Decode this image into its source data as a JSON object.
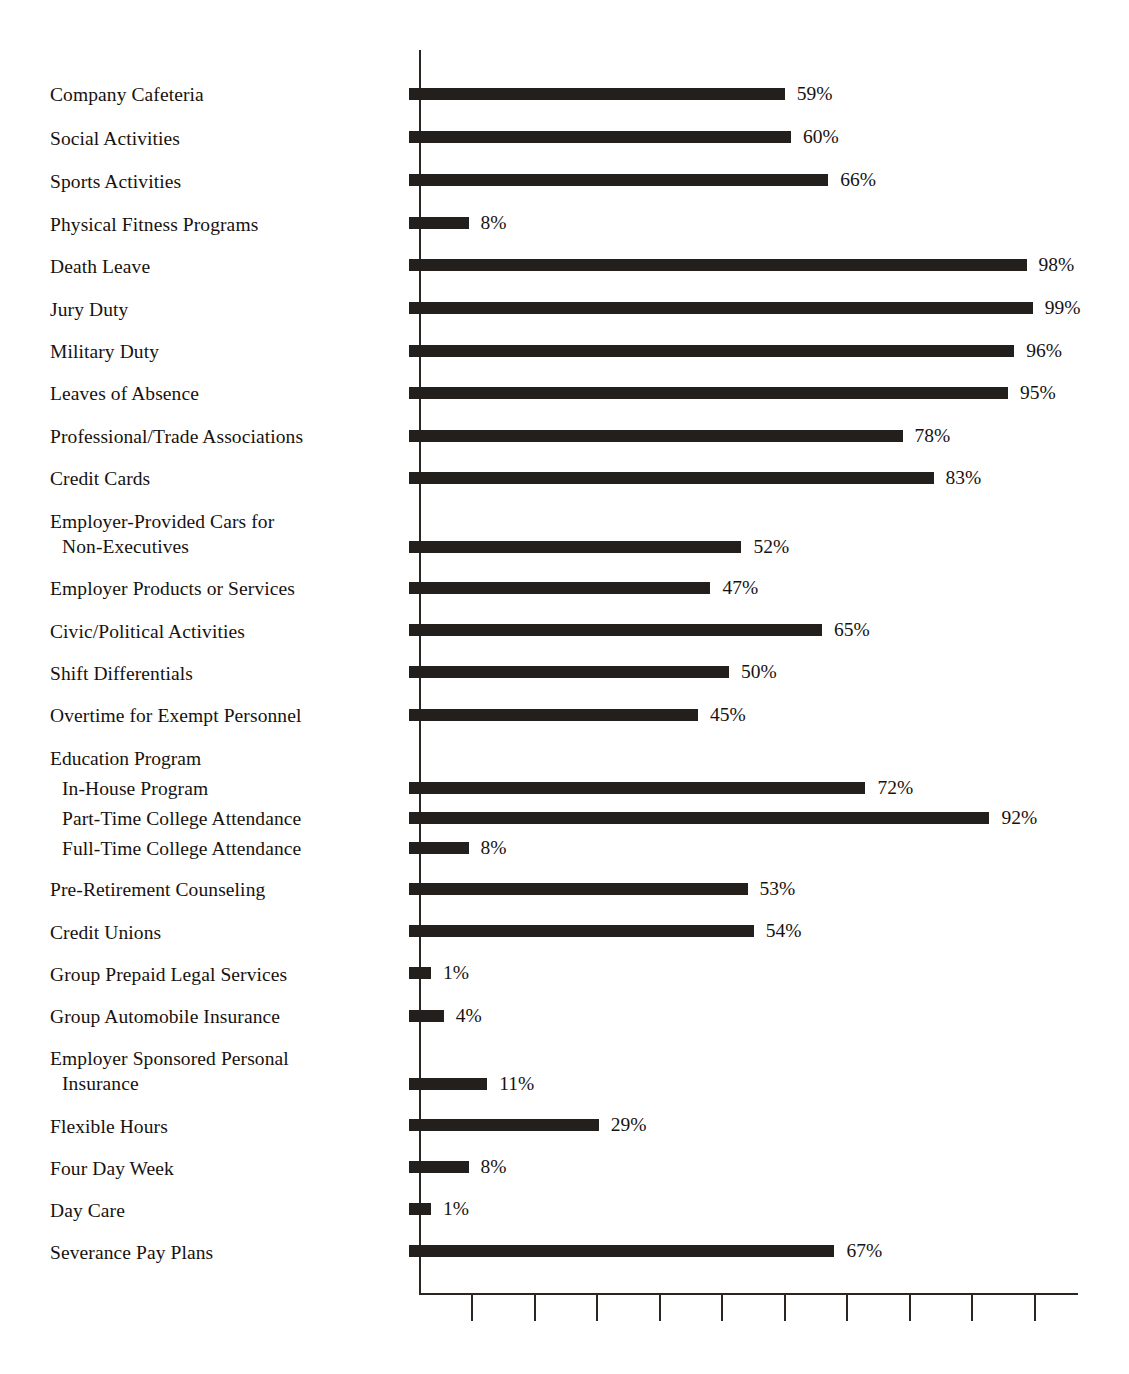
{
  "chart_data": {
    "type": "bar",
    "orientation": "horizontal",
    "title": "",
    "subtitle": "",
    "xlabel": "",
    "ylabel": "",
    "xlim": [
      0,
      100
    ],
    "grid": false,
    "legend": null,
    "value_suffix": "%",
    "axis": {
      "tick_count": 10,
      "tick_values": [
        10,
        20,
        30,
        40,
        50,
        60,
        70,
        80,
        90,
        100
      ],
      "tick_labels": [
        "",
        "",
        "",
        "",
        "",
        "",
        "",
        "",
        "",
        ""
      ],
      "tick_labels_visible": false,
      "axis_color": "#2b2622"
    },
    "bar_color": "#231f1c",
    "categories": [
      "Company Cafeteria",
      "Social Activities",
      "Sports Activities",
      "Physical Fitness Programs",
      "Death Leave",
      "Jury Duty",
      "Military Duty",
      "Leaves of Absence",
      "Professional/Trade Associations",
      "Credit Cards",
      "Employer-Provided Cars for Non-Executives",
      "Employer Products or Services",
      "Civic/Political Activities",
      "Shift Differentials",
      "Overtime for Exempt Personnel",
      "In-House Program",
      "Part-Time College Attendance",
      "Full-Time College Attendance",
      "Pre-Retirement Counseling",
      "Credit Unions",
      "Group Prepaid Legal Services",
      "Group Automobile Insurance",
      "Employer Sponsored Personal Insurance",
      "Flexible Hours",
      "Four Day Week",
      "Day Care",
      "Severance Pay Plans"
    ],
    "values": [
      59,
      60,
      66,
      8,
      98,
      99,
      96,
      95,
      78,
      83,
      52,
      47,
      65,
      50,
      45,
      72,
      92,
      8,
      53,
      54,
      1,
      4,
      11,
      29,
      8,
      1,
      67
    ]
  },
  "rows": [
    {
      "label_lines": [
        "Company Cafeteria"
      ],
      "indent": 0,
      "value": 59,
      "value_label": "59%",
      "label_top": 82,
      "bar_top": 88
    },
    {
      "label_lines": [
        "Social Activities"
      ],
      "indent": 0,
      "value": 60,
      "value_label": "60%",
      "label_top": 126,
      "bar_top": 131
    },
    {
      "label_lines": [
        "Sports Activities"
      ],
      "indent": 0,
      "value": 66,
      "value_label": "66%",
      "label_top": 169,
      "bar_top": 174
    },
    {
      "label_lines": [
        "Physical Fitness Programs"
      ],
      "indent": 0,
      "value": 8,
      "value_label": "8%",
      "label_top": 212,
      "bar_top": 217
    },
    {
      "label_lines": [
        "Death Leave"
      ],
      "indent": 0,
      "value": 98,
      "value_label": "98%",
      "label_top": 254,
      "bar_top": 259
    },
    {
      "label_lines": [
        "Jury Duty"
      ],
      "indent": 0,
      "value": 99,
      "value_label": "99%",
      "label_top": 297,
      "bar_top": 302
    },
    {
      "label_lines": [
        "Military Duty"
      ],
      "indent": 0,
      "value": 96,
      "value_label": "96%",
      "label_top": 339,
      "bar_top": 345
    },
    {
      "label_lines": [
        "Leaves of Absence"
      ],
      "indent": 0,
      "value": 95,
      "value_label": "95%",
      "label_top": 381,
      "bar_top": 387
    },
    {
      "label_lines": [
        "Professional/Trade Associations"
      ],
      "indent": 0,
      "value": 78,
      "value_label": "78%",
      "label_top": 424,
      "bar_top": 430
    },
    {
      "label_lines": [
        "Credit Cards"
      ],
      "indent": 0,
      "value": 83,
      "value_label": "83%",
      "label_top": 466,
      "bar_top": 472
    },
    {
      "label_lines": [
        "Employer-Provided Cars for",
        "Non-Executives"
      ],
      "indent": 0,
      "value": 52,
      "value_label": "52%",
      "label_top": 509,
      "bar_top": 541
    },
    {
      "label_lines": [
        "Employer Products or Services"
      ],
      "indent": 0,
      "value": 47,
      "value_label": "47%",
      "label_top": 576,
      "bar_top": 582
    },
    {
      "label_lines": [
        "Civic/Political Activities"
      ],
      "indent": 0,
      "value": 65,
      "value_label": "65%",
      "label_top": 619,
      "bar_top": 624
    },
    {
      "label_lines": [
        "Shift Differentials"
      ],
      "indent": 0,
      "value": 50,
      "value_label": "50%",
      "label_top": 661,
      "bar_top": 666
    },
    {
      "label_lines": [
        "Overtime for Exempt Personnel"
      ],
      "indent": 0,
      "value": 45,
      "value_label": "45%",
      "label_top": 703,
      "bar_top": 709
    },
    {
      "label_lines": [
        "In-House Program"
      ],
      "indent": 1,
      "value": 72,
      "value_label": "72%",
      "label_top": 776,
      "bar_top": 782
    },
    {
      "label_lines": [
        "Part-Time College Attendance"
      ],
      "indent": 1,
      "value": 92,
      "value_label": "92%",
      "label_top": 806,
      "bar_top": 812
    },
    {
      "label_lines": [
        "Full-Time College Attendance"
      ],
      "indent": 1,
      "value": 8,
      "value_label": "8%",
      "label_top": 836,
      "bar_top": 842
    },
    {
      "label_lines": [
        "Pre-Retirement Counseling"
      ],
      "indent": 0,
      "value": 53,
      "value_label": "53%",
      "label_top": 877,
      "bar_top": 883
    },
    {
      "label_lines": [
        "Credit Unions"
      ],
      "indent": 0,
      "value": 54,
      "value_label": "54%",
      "label_top": 920,
      "bar_top": 925
    },
    {
      "label_lines": [
        "Group Prepaid Legal Services"
      ],
      "indent": 0,
      "value": 1,
      "value_label": "1%",
      "label_top": 962,
      "bar_top": 967
    },
    {
      "label_lines": [
        "Group Automobile Insurance"
      ],
      "indent": 0,
      "value": 4,
      "value_label": "4%",
      "label_top": 1004,
      "bar_top": 1010
    },
    {
      "label_lines": [
        "Employer Sponsored Personal",
        "Insurance"
      ],
      "indent": 0,
      "value": 11,
      "value_label": "11%",
      "label_top": 1046,
      "bar_top": 1078
    },
    {
      "label_lines": [
        "Flexible Hours"
      ],
      "indent": 0,
      "value": 29,
      "value_label": "29%",
      "label_top": 1114,
      "bar_top": 1119
    },
    {
      "label_lines": [
        "Four Day Week"
      ],
      "indent": 0,
      "value": 8,
      "value_label": "8%",
      "label_top": 1156,
      "bar_top": 1161
    },
    {
      "label_lines": [
        "Day Care"
      ],
      "indent": 0,
      "value": 1,
      "value_label": "1%",
      "label_top": 1198,
      "bar_top": 1203
    },
    {
      "label_lines": [
        "Severance Pay Plans"
      ],
      "indent": 0,
      "value": 67,
      "value_label": "67%",
      "label_top": 1240,
      "bar_top": 1245
    }
  ],
  "group_headers": [
    {
      "label": "Education Program",
      "top": 746
    }
  ],
  "geometry": {
    "axis_x": 419,
    "axis_top": 50,
    "axis_bottom": 1293,
    "axis_right": 1078,
    "px_per_percent": 6.2,
    "bar_height": 12,
    "min_bar_width": 12,
    "value_gap": 12,
    "tick_length": 26,
    "first_tick_offset": 52,
    "tick_spacing": 62.5
  }
}
